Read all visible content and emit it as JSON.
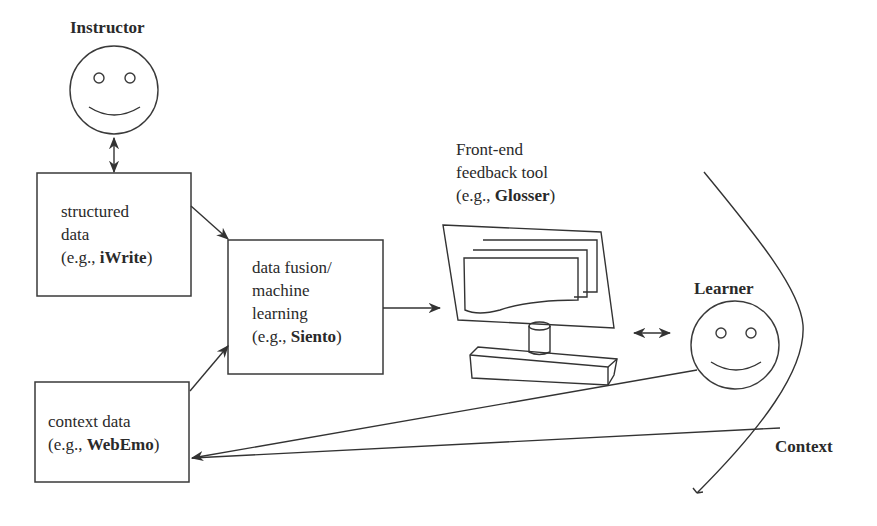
{
  "actors": {
    "instructor": {
      "label": "Instructor"
    },
    "learner": {
      "label": "Learner"
    },
    "context": {
      "label": "Context"
    }
  },
  "boxes": {
    "structured": {
      "lines": [
        "structured",
        "data"
      ],
      "example_prefix": "(e.g., ",
      "example_name": "iWrite",
      "example_suffix": ")"
    },
    "fusion": {
      "lines": [
        "data fusion/",
        "machine",
        "learning"
      ],
      "example_prefix": "(e.g., ",
      "example_name": "Siento",
      "example_suffix": ")"
    },
    "context": {
      "lines": [
        "context data"
      ],
      "example_prefix": "(e.g., ",
      "example_name": "WebEmo",
      "example_suffix": ")"
    }
  },
  "frontend": {
    "lines": [
      "Front-end",
      "feedback tool"
    ],
    "example_prefix": "(e.g., ",
    "example_name": "Glosser",
    "example_suffix": ")"
  },
  "colors": {
    "stroke": "#333333",
    "text": "#2a2a2a",
    "background": "#ffffff"
  }
}
